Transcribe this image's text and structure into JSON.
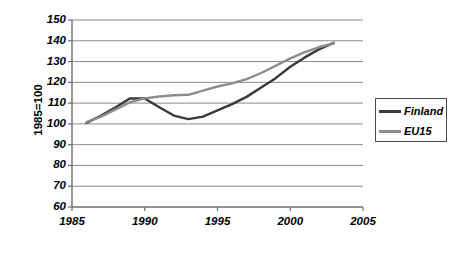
{
  "chart_data": {
    "type": "line",
    "title": "",
    "xlabel": "",
    "ylabel": "1985=100",
    "xlim": [
      1985,
      2005
    ],
    "ylim": [
      60,
      150
    ],
    "xticks": [
      1985,
      1990,
      1995,
      2000,
      2005
    ],
    "yticks": [
      60,
      70,
      80,
      90,
      100,
      110,
      120,
      130,
      140,
      150
    ],
    "grid": true,
    "legend_position": "right",
    "x": [
      1986,
      1987,
      1988,
      1989,
      1990,
      1991,
      1992,
      1993,
      1994,
      1995,
      1996,
      1997,
      1998,
      1999,
      2000,
      2001,
      2002,
      2003
    ],
    "series": [
      {
        "name": "Finland",
        "color": "#3a3a3a",
        "values": [
          100.5,
          104.0,
          108.0,
          112.3,
          112.2,
          108.0,
          104.0,
          102.3,
          103.5,
          106.5,
          109.5,
          113.0,
          117.5,
          122.0,
          127.5,
          132.0,
          136.0,
          139.0
        ]
      },
      {
        "name": "EU15",
        "color": "#8c8c8c",
        "values": [
          100.8,
          103.5,
          107.0,
          110.5,
          112.3,
          113.2,
          113.8,
          114.0,
          116.0,
          118.0,
          119.5,
          121.5,
          124.5,
          128.0,
          131.5,
          134.5,
          137.0,
          138.8
        ]
      }
    ]
  },
  "legend": {
    "items": [
      {
        "label": "Finland"
      },
      {
        "label": "EU15"
      }
    ]
  },
  "axes": {
    "y_title": "1985=100",
    "y_labels": [
      "150",
      "140",
      "130",
      "120",
      "110",
      "100",
      "90",
      "80",
      "70",
      "60"
    ],
    "x_labels": [
      "1985",
      "1990",
      "1995",
      "2000",
      "2005"
    ]
  }
}
